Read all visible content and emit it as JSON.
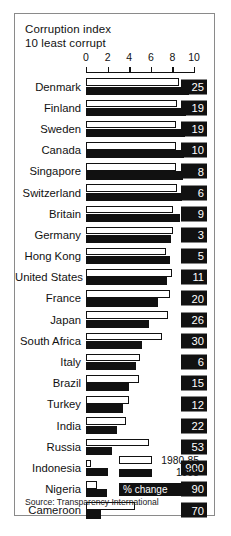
{
  "chart_data": {
    "type": "bar",
    "title": "Corruption index",
    "subtitle": "10 least corrupt",
    "orientation": "horizontal",
    "xlabel": "",
    "ylabel": "",
    "xlim": [
      0,
      10
    ],
    "xticks": [
      0,
      2,
      4,
      6,
      8,
      10
    ],
    "grid": false,
    "legend_position": "inside-bottom-right",
    "categories": [
      "Denmark",
      "Finland",
      "Sweden",
      "Canada",
      "Singapore",
      "Switzerland",
      "Britain",
      "Germany",
      "Hong Kong",
      "United States",
      "France",
      "Japan",
      "South Africa",
      "Italy",
      "Brazil",
      "Turkey",
      "India",
      "Russia",
      "Indonesia",
      "Nigeria",
      "Cameroon"
    ],
    "series": [
      {
        "name": "1980-85",
        "style": "outline",
        "values": [
          8.6,
          8.4,
          8.3,
          8.3,
          8.3,
          8.4,
          8.1,
          8.1,
          7.4,
          8.0,
          7.8,
          7.6,
          7.0,
          5.0,
          4.9,
          4.0,
          3.7,
          5.8,
          0.5,
          1.0,
          4.5
        ]
      },
      {
        "name": "1998",
        "style": "solid",
        "values": [
          9.5,
          9.3,
          9.2,
          9.1,
          9.0,
          8.9,
          8.7,
          7.9,
          7.8,
          7.5,
          6.7,
          5.8,
          5.2,
          4.6,
          4.0,
          3.4,
          2.9,
          2.4,
          2.0,
          1.9,
          1.4
        ]
      }
    ],
    "value_column_header": "% change",
    "values": [
      25,
      19,
      19,
      10,
      8,
      6,
      9,
      3,
      5,
      11,
      20,
      26,
      30,
      6,
      15,
      12,
      22,
      53,
      900,
      90,
      70
    ],
    "source": "Source: Transparency International"
  },
  "legend": {
    "old_label": "1980-85",
    "new_label": "1998"
  },
  "callout": {
    "label": "% change"
  }
}
